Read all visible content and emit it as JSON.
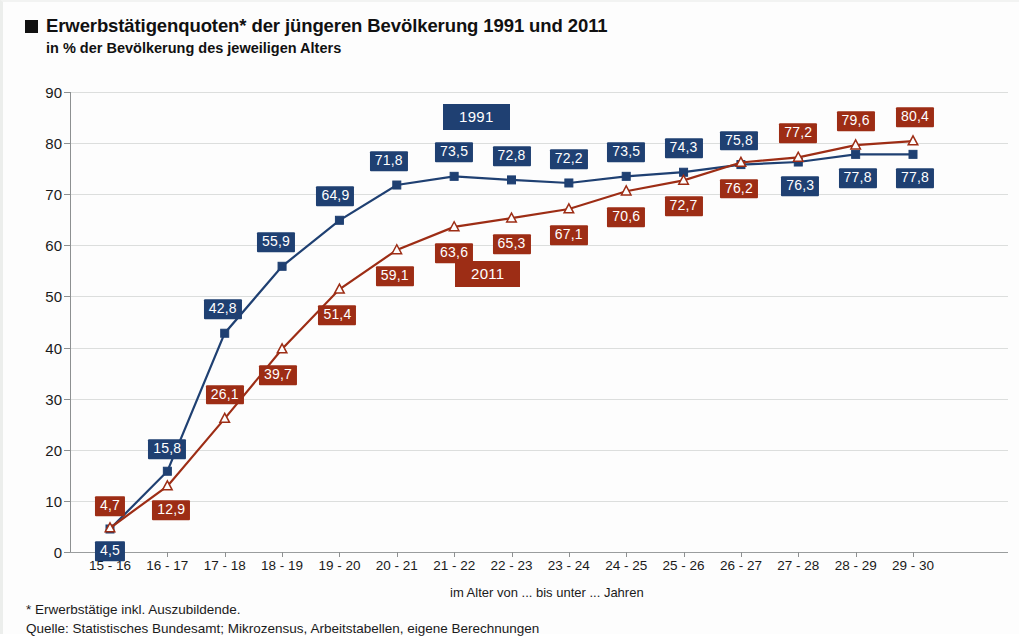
{
  "header": {
    "bullet_icon": "black-square-bullet",
    "title": "Erwerbstätigenquoten* der jüngeren Bevölkerung 1991 und 2011",
    "subtitle": "in % der Bevölkerung des jeweiligen Alters"
  },
  "axis_note": "im Alter von ... bis unter ... Jahren",
  "footnotes": {
    "line1": "* Erwerbstätige inkl. Auszubildende.",
    "line2": "Quelle: Statistisches Bundesamt; Mikrozensus, Arbeitstabellen, eigene Berechnungen"
  },
  "legend": {
    "series1": "1991",
    "series2": "2011"
  },
  "colors": {
    "series1": "#1f4072",
    "series2": "#9d2d15",
    "series1_line": "#1f4072",
    "series2_line": "#9d2d15",
    "grid": "#dcdedd",
    "axis": "#8d9091",
    "background": "#fdfdfd",
    "text": "#1a1a1a"
  },
  "chart_data": {
    "type": "line",
    "title": "Erwerbstätigenquoten* der jüngeren Bevölkerung 1991 und 2011",
    "subtitle": "in % der Bevölkerung des jeweiligen Alters",
    "xlabel": "im Alter von ... bis unter ... Jahren",
    "ylabel": "",
    "ylim": [
      0,
      90
    ],
    "yticks": [
      0,
      10,
      20,
      30,
      40,
      50,
      60,
      70,
      80,
      90
    ],
    "ytick_labels": [
      "0",
      "10",
      "20",
      "30",
      "40",
      "50",
      "60",
      "70",
      "80",
      "90"
    ],
    "grid": true,
    "legend_position": "inside-center",
    "categories": [
      "15 - 16",
      "16 - 17",
      "17 - 18",
      "18 - 19",
      "19 - 20",
      "20 - 21",
      "21 - 22",
      "22 - 23",
      "23 - 24",
      "24 - 25",
      "25 - 26",
      "26 - 27",
      "27 - 28",
      "28 - 29",
      "29 - 30"
    ],
    "series": [
      {
        "name": "1991",
        "color": "#1f4072",
        "marker": "filled-square",
        "label_position": "above",
        "values": [
          4.5,
          15.8,
          42.8,
          55.9,
          64.9,
          71.8,
          73.5,
          72.8,
          72.2,
          73.5,
          74.3,
          75.8,
          76.3,
          77.8,
          77.8
        ],
        "value_labels": [
          "4,5",
          "15,8",
          "42,8",
          "55,9",
          "64,9",
          "71,8",
          "73,5",
          "72,8",
          "72,2",
          "73,5",
          "74,3",
          "75,8",
          "76,3",
          "77,8",
          "77,8"
        ]
      },
      {
        "name": "2011",
        "color": "#9d2d15",
        "marker": "open-triangle",
        "label_position": "below",
        "values": [
          4.7,
          12.9,
          26.1,
          39.7,
          51.4,
          59.1,
          63.6,
          65.3,
          67.1,
          70.6,
          72.7,
          76.2,
          77.2,
          79.6,
          80.4
        ],
        "value_labels": [
          "4,7",
          "12,9",
          "26,1",
          "39,7",
          "51,4",
          "59,1",
          "63,6",
          "65,3",
          "67,1",
          "70,6",
          "72,7",
          "76,2",
          "77,2",
          "79,6",
          "80,4"
        ]
      }
    ]
  }
}
